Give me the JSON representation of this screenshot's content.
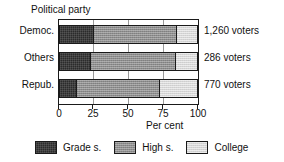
{
  "chart_data": {
    "type": "bar",
    "orientation": "horizontal",
    "stacked": true,
    "stacked_mode": "percent",
    "title": "Political party",
    "xlabel": "Per cent",
    "ylabel": "",
    "xlim": [
      0,
      100
    ],
    "xticks": [
      0,
      25,
      50,
      75,
      100
    ],
    "xticklabels": [
      "0",
      "25",
      "50",
      "75",
      "100"
    ],
    "grid": true,
    "legend_position": "bottom",
    "categories": [
      "Democ.",
      "Others",
      "Repub."
    ],
    "series": [
      {
        "name": "Grade s.",
        "values": [
          25,
          23,
          13
        ],
        "color": "#2b2b2b"
      },
      {
        "name": "High s.",
        "values": [
          60,
          61,
          60
        ],
        "color": "#8e8e8e"
      },
      {
        "name": "College",
        "values": [
          15,
          16,
          27
        ],
        "color": "#d6d6d6"
      }
    ],
    "annotations": [
      "1,260 voters",
      "286 voters",
      "770 voters"
    ]
  },
  "title": {
    "text": "Political party"
  },
  "categories": [
    {
      "label": "Democ."
    },
    {
      "label": "Others"
    },
    {
      "label": "Repub."
    }
  ],
  "annotations": [
    {
      "text": "1,260 voters"
    },
    {
      "text": "286 voters"
    },
    {
      "text": "770 voters"
    }
  ],
  "xaxis": {
    "title": "Per cent",
    "ticks": [
      {
        "label": "0"
      },
      {
        "label": "25"
      },
      {
        "label": "50"
      },
      {
        "label": "75"
      },
      {
        "label": "100"
      }
    ]
  },
  "legend": {
    "items": [
      {
        "label": "Grade s."
      },
      {
        "label": "High s."
      },
      {
        "label": "College"
      }
    ]
  }
}
